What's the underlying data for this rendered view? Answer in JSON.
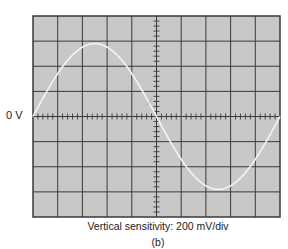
{
  "figure": {
    "zero_label": "0 V",
    "caption": "Vertical sensitivity: 200 mV/div",
    "sublabel": "(b)"
  },
  "colors": {
    "screen": "#c8c8c8",
    "grid": "#3a3a3a",
    "trace": "#f4f4f4"
  },
  "chart_data": {
    "type": "line",
    "xlabel": "",
    "ylabel": "",
    "grid": true,
    "divisions": {
      "horizontal": 10,
      "vertical": 8
    },
    "vertical_sensitivity_mV_per_div": 200,
    "waveform": "sine",
    "cycles_shown": 1,
    "amplitude_div": 2.9,
    "amplitude_mV": 580,
    "peak_to_peak_mV": 1160,
    "x_div": [
      0,
      1.25,
      2.5,
      3.75,
      5,
      6.25,
      7.5,
      8.75,
      10
    ],
    "y_div": [
      0,
      2.05,
      2.9,
      2.05,
      0,
      -2.05,
      -2.9,
      -2.05,
      0
    ]
  }
}
